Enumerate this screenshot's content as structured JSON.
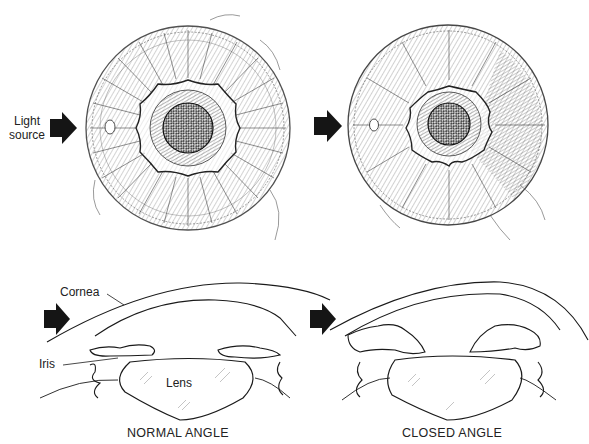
{
  "figure": {
    "top_panels": [
      {
        "id": "normal-iris",
        "light_label": "Light\nsource"
      },
      {
        "id": "closed-iris"
      }
    ],
    "labels": {
      "light_source_line1": "Light",
      "light_source_line2": "source",
      "cornea": "Cornea",
      "iris": "Iris",
      "lens": "Lens"
    },
    "captions": {
      "normal": "NORMAL ANGLE",
      "closed": "CLOSED ANGLE"
    },
    "colors": {
      "ink": "#1a1a1a",
      "arrow": "#151515",
      "pupil": "#222222",
      "background": "#ffffff"
    }
  }
}
